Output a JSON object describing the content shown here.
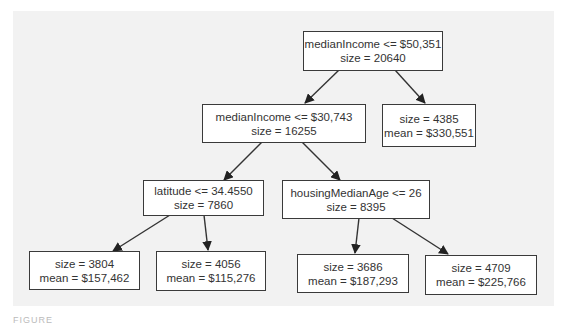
{
  "diagram": {
    "type": "decision-tree",
    "nodes": {
      "root": {
        "line1": "medianIncome <= $50,351",
        "line2": "size = 20640"
      },
      "left": {
        "line1": "medianIncome <= $30,743",
        "line2": "size = 16255"
      },
      "right_leaf": {
        "line1": "size = 4385",
        "line2": "mean = $330,551"
      },
      "left_left": {
        "line1": "latitude <= 34.4550",
        "line2": "size = 7860"
      },
      "left_right": {
        "line1": "housingMedianAge <= 26",
        "line2": "size = 8395"
      },
      "leaf_1": {
        "line1": "size = 3804",
        "line2": "mean = $157,462"
      },
      "leaf_2": {
        "line1": "size = 4056",
        "line2": "mean = $115,276"
      },
      "leaf_3": {
        "line1": "size = 3686",
        "line2": "mean = $187,293"
      },
      "leaf_4": {
        "line1": "size = 4709",
        "line2": "mean = $225,766"
      }
    },
    "edges": [
      [
        "root",
        "left"
      ],
      [
        "root",
        "right_leaf"
      ],
      [
        "left",
        "left_left"
      ],
      [
        "left",
        "left_right"
      ],
      [
        "left_left",
        "leaf_1"
      ],
      [
        "left_left",
        "leaf_2"
      ],
      [
        "left_right",
        "leaf_3"
      ],
      [
        "left_right",
        "leaf_4"
      ]
    ],
    "colors": {
      "background": "#f2f2f2",
      "node_fill": "#ffffff",
      "stroke": "#3a3a3a",
      "text": "#333333"
    }
  },
  "caption": "FIGURE"
}
